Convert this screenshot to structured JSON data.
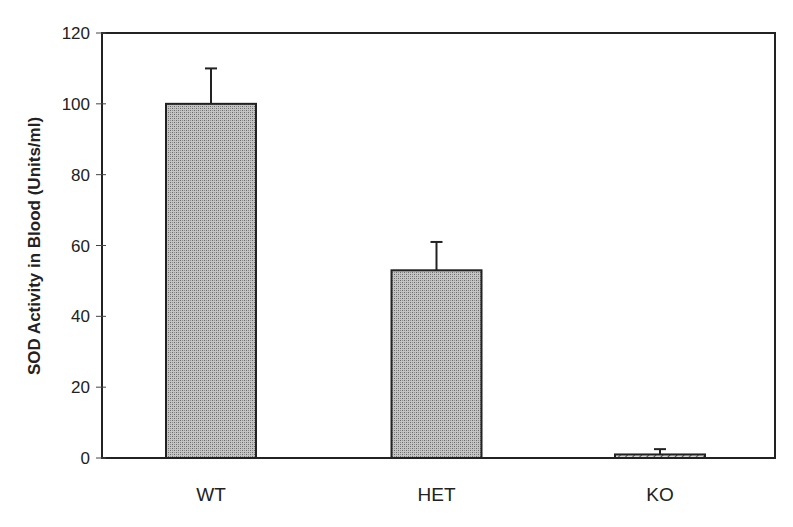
{
  "chart_data": {
    "type": "bar",
    "title": "",
    "xlabel": "",
    "ylabel": "SOD Activity in Blood (Units/ml)",
    "categories": [
      "WT",
      "HET",
      "KO"
    ],
    "values": [
      100,
      53,
      1
    ],
    "error_upper": [
      110,
      61,
      2.5
    ],
    "errors": [
      10,
      8,
      1.5
    ],
    "ylim": [
      0,
      120
    ],
    "yticks": [
      0,
      20,
      40,
      60,
      80,
      100,
      120
    ],
    "grid": false,
    "legend": null,
    "bar_styles": [
      "stippled-gray",
      "stippled-gray",
      "diagonal-hatch"
    ]
  },
  "axis": {
    "y_title": "SOD Activity in Blood (Units/ml)",
    "y_tick_labels": [
      "0",
      "20",
      "40",
      "60",
      "80",
      "100",
      "120"
    ],
    "x_tick_labels": [
      "WT",
      "HET",
      "KO"
    ]
  },
  "colors": {
    "bar_fill": "#a8a8a8",
    "stroke": "#222222",
    "background": "#ffffff"
  }
}
